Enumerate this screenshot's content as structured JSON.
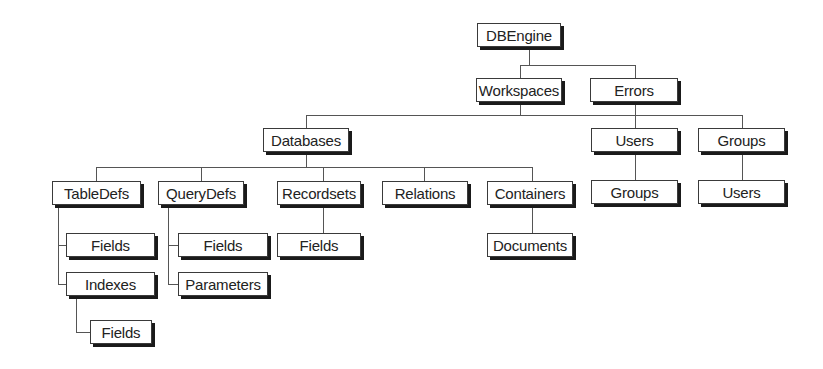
{
  "diagram": {
    "nodes": {
      "dbengine": {
        "label": "DBEngine"
      },
      "workspaces": {
        "label": "Workspaces"
      },
      "errors": {
        "label": "Errors"
      },
      "databases": {
        "label": "Databases"
      },
      "users": {
        "label": "Users"
      },
      "groups": {
        "label": "Groups"
      },
      "users_groups": {
        "label": "Groups"
      },
      "groups_users": {
        "label": "Users"
      },
      "tabledefs": {
        "label": "TableDefs"
      },
      "querydefs": {
        "label": "QueryDefs"
      },
      "recordsets": {
        "label": "Recordsets"
      },
      "relations": {
        "label": "Relations"
      },
      "containers": {
        "label": "Containers"
      },
      "tabledefs_fields": {
        "label": "Fields"
      },
      "tabledefs_indexes": {
        "label": "Indexes"
      },
      "indexes_fields": {
        "label": "Fields"
      },
      "querydefs_fields": {
        "label": "Fields"
      },
      "querydefs_parameters": {
        "label": "Parameters"
      },
      "recordsets_fields": {
        "label": "Fields"
      },
      "containers_documents": {
        "label": "Documents"
      }
    },
    "edges": [
      [
        "DBEngine",
        "Workspaces"
      ],
      [
        "DBEngine",
        "Errors"
      ],
      [
        "Workspaces",
        "Databases"
      ],
      [
        "Workspaces",
        "Users"
      ],
      [
        "Workspaces",
        "Groups"
      ],
      [
        "Users",
        "Groups"
      ],
      [
        "Groups",
        "Users"
      ],
      [
        "Databases",
        "TableDefs"
      ],
      [
        "Databases",
        "QueryDefs"
      ],
      [
        "Databases",
        "Recordsets"
      ],
      [
        "Databases",
        "Relations"
      ],
      [
        "Databases",
        "Containers"
      ],
      [
        "TableDefs",
        "Fields"
      ],
      [
        "TableDefs",
        "Indexes"
      ],
      [
        "Indexes",
        "Fields"
      ],
      [
        "QueryDefs",
        "Fields"
      ],
      [
        "QueryDefs",
        "Parameters"
      ],
      [
        "Recordsets",
        "Fields"
      ],
      [
        "Containers",
        "Documents"
      ]
    ]
  }
}
